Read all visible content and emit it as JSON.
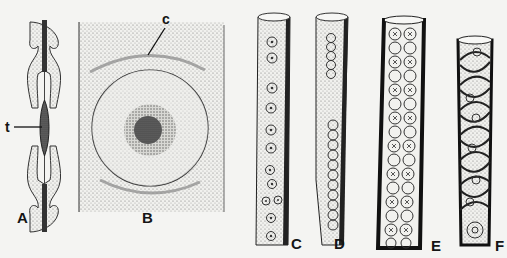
{
  "figure": {
    "panels": [
      {
        "id": "A",
        "label": "A",
        "description": "Longitudinal section of bordered pit pair with torus"
      },
      {
        "id": "B",
        "label": "B",
        "description": "Face view of bordered pit with torus and crassulae"
      },
      {
        "id": "C",
        "label": "C",
        "description": "Tracheid with uniseriate bordered pits"
      },
      {
        "id": "D",
        "label": "D",
        "description": "Tracheid with crowded uniseriate pits"
      },
      {
        "id": "E",
        "label": "E",
        "description": "Tracheid with alternate crowded pits"
      },
      {
        "id": "F",
        "label": "F",
        "description": "Tracheid with helical thickenings and pits"
      }
    ],
    "annotations": [
      {
        "label": "t",
        "target": "torus"
      },
      {
        "label": "c",
        "target": "crassula"
      }
    ]
  }
}
